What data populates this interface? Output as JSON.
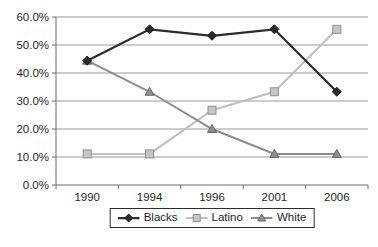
{
  "chart_data": {
    "type": "line",
    "title": "",
    "xlabel": "",
    "ylabel": "",
    "categories": [
      "1990",
      "1994",
      "1996",
      "2001",
      "2006"
    ],
    "series": [
      {
        "name": "Blacks",
        "values": [
          44.4,
          55.6,
          53.3,
          55.6,
          33.3
        ],
        "color": "#2b2b2b",
        "line_width": 2.25,
        "marker": "diamond",
        "marker_fill": "#2b2b2b",
        "marker_stroke": "#1a1a1a"
      },
      {
        "name": "Latino",
        "values": [
          11.1,
          11.1,
          26.7,
          33.3,
          55.6
        ],
        "color": "#bfbfbf",
        "line_width": 2,
        "marker": "square",
        "marker_fill": "#c6c6c6",
        "marker_stroke": "#8f8f8f"
      },
      {
        "name": "White",
        "values": [
          44.4,
          33.3,
          20.0,
          11.1,
          11.1
        ],
        "color": "#8c8c8c",
        "line_width": 2,
        "marker": "triangle",
        "marker_fill": "#8f8f8f",
        "marker_stroke": "#666666"
      }
    ],
    "ylim": [
      0,
      60
    ],
    "ytick_step": 10,
    "ytick_labels": [
      "0.0%",
      "10.0%",
      "20.0%",
      "30.0%",
      "40.0%",
      "50.0%",
      "60.0%"
    ],
    "grid": true,
    "legend_position": "bottom"
  },
  "colors": {
    "background": "#ffffff",
    "grid": "#999999",
    "axis": "#6b6b6b",
    "text": "#1f1f1f",
    "legend_border": "#2b2b2b"
  }
}
